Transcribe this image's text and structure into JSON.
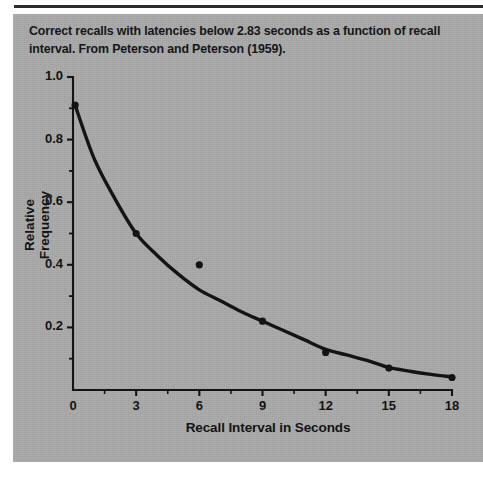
{
  "figure": {
    "caption": "Correct recalls with latencies below 2.83 seconds as a function of recall interval. From Peterson and Peterson (1959).",
    "panel_color": "#a8a8a8",
    "ink_color": "#141414"
  },
  "chart_data": {
    "type": "scatter",
    "title": "",
    "subtitle": "",
    "xlabel": "Recall Interval in Seconds",
    "ylabel": "Relative Frequency",
    "xlim": [
      0,
      18
    ],
    "ylim": [
      0,
      1.0
    ],
    "grid": false,
    "legend": "none",
    "x_ticks": [
      0,
      3,
      6,
      9,
      12,
      15,
      18
    ],
    "x_tick_labels": [
      "0",
      "3",
      "6",
      "9",
      "12",
      "15",
      "18"
    ],
    "x_minor_ticks": [
      1.5,
      4.5,
      7.5,
      10.5,
      13.5,
      16.5
    ],
    "y_ticks": [
      0.2,
      0.4,
      0.6,
      0.8,
      1.0
    ],
    "y_tick_labels": [
      "0.2",
      "0.4",
      "0.6",
      "0.8",
      "1.0"
    ],
    "y_minor_ticks": [
      0.1,
      0.3,
      0.5,
      0.7,
      0.9
    ],
    "series": [
      {
        "name": "Observed relative frequency",
        "marker": "filled-circle",
        "x": [
          0.1,
          3,
          6,
          9,
          12,
          15,
          18
        ],
        "values": [
          0.91,
          0.5,
          0.4,
          0.22,
          0.12,
          0.07,
          0.04
        ]
      },
      {
        "name": "Fitted decay curve",
        "marker": "line",
        "x": [
          0.1,
          1,
          2,
          3,
          4,
          5,
          6,
          7,
          8,
          9,
          10,
          11,
          12,
          13,
          14,
          15,
          16,
          17,
          18
        ],
        "values": [
          0.91,
          0.74,
          0.61,
          0.5,
          0.43,
          0.37,
          0.32,
          0.285,
          0.25,
          0.22,
          0.19,
          0.16,
          0.13,
          0.112,
          0.094,
          0.072,
          0.06,
          0.05,
          0.042
        ]
      }
    ],
    "annotations": []
  }
}
